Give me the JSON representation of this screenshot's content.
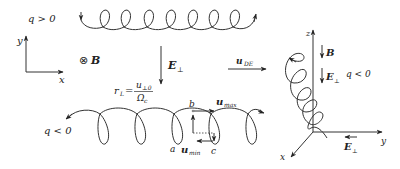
{
  "diagram": {
    "top_panel": {
      "charge_label": "q > 0",
      "loops": 7
    },
    "left_axes": {
      "y_label": "y",
      "x_label": "x",
      "field_label": "⊗",
      "field_symbol": "B"
    },
    "center": {
      "efield_label": "E",
      "efield_sub": "⊥",
      "larmor_label": "r",
      "larmor_sub": "L",
      "larmor_eq": "=",
      "larmor_num": "u",
      "larmor_num_sub": "⊥0",
      "larmor_den": "Ω",
      "larmor_den_sub": "c"
    },
    "bottom_panel": {
      "charge_label": "q < 0",
      "loops": 5,
      "point_a": "a",
      "point_b": "b",
      "point_c": "c",
      "u_max": "u",
      "u_max_sub": "max",
      "u_min": "u",
      "u_min_sub": "min"
    },
    "drift": {
      "label": "u",
      "sub": "DE"
    },
    "right_panel": {
      "z_label": "z",
      "y_label": "y",
      "x_label": "x",
      "b_label": "B",
      "e_label": "E",
      "e_sub": "⊥",
      "charge_label": "q < 0",
      "e_bottom": "E",
      "e_bottom_sub": "⊥"
    },
    "colors": {
      "line": "#333333",
      "text": "#222222",
      "background": "#ffffff"
    }
  }
}
